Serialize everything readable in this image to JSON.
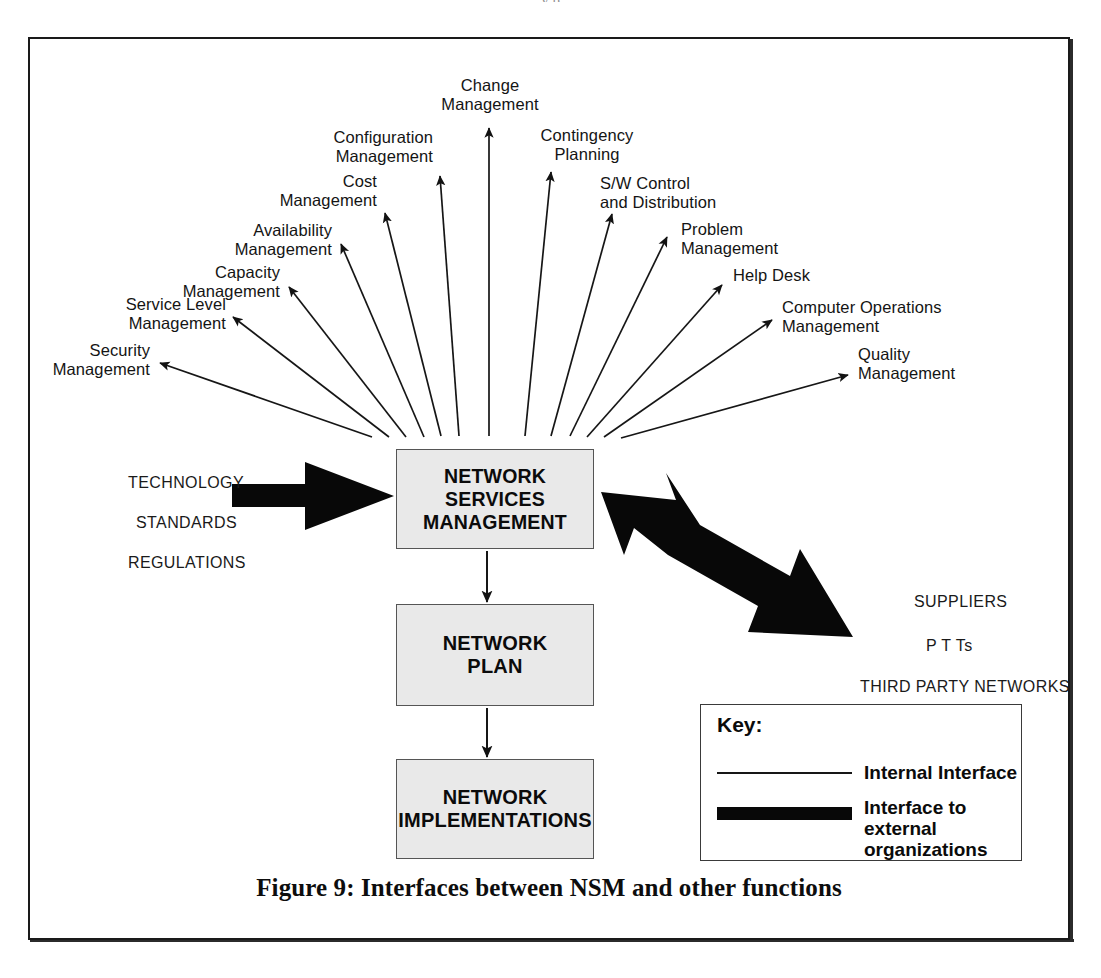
{
  "figure": {
    "caption": "Figure 9: Interfaces between NSM and other functions",
    "top_partial_text": "y   p"
  },
  "fan_functions": [
    {
      "id": "security-management",
      "label": "Security\nManagement"
    },
    {
      "id": "service-level-management",
      "label": "Service Level\nManagement"
    },
    {
      "id": "capacity-management",
      "label": "Capacity\nManagement"
    },
    {
      "id": "availability-management",
      "label": "Availability\nManagement"
    },
    {
      "id": "cost-management",
      "label": "Cost\nManagement"
    },
    {
      "id": "configuration-management",
      "label": "Configuration\nManagement"
    },
    {
      "id": "change-management",
      "label": "Change\nManagement"
    },
    {
      "id": "contingency-planning",
      "label": "Contingency\nPlanning"
    },
    {
      "id": "sw-control-and-distribution",
      "label": "S/W Control\nand Distribution"
    },
    {
      "id": "problem-management",
      "label": "Problem\nManagement"
    },
    {
      "id": "help-desk",
      "label": "Help Desk"
    },
    {
      "id": "computer-operations-management",
      "label": "Computer Operations\nManagement"
    },
    {
      "id": "quality-management",
      "label": "Quality\nManagement"
    }
  ],
  "boxes": {
    "nsm": {
      "label": "NETWORK\nSERVICES\nMANAGEMENT"
    },
    "plan": {
      "label": "NETWORK\nPLAN"
    },
    "impl": {
      "label": "NETWORK\nIMPLEMENTATIONS"
    }
  },
  "external_inputs": {
    "items": [
      "TECHNOLOGY",
      "STANDARDS",
      "REGULATIONS"
    ]
  },
  "external_parties": {
    "items": [
      "SUPPLIERS",
      "P T Ts",
      "THIRD PARTY NETWORKS"
    ]
  },
  "key": {
    "title": "Key:",
    "internal_label": "Internal Interface",
    "external_label": "Interface to external organizations"
  },
  "colors": {
    "ink": "#111111",
    "box_fill": "#e9e9e9",
    "box_border": "#555555",
    "frame": "#1a1a1a",
    "thick_arrow": "#080808"
  },
  "diagram_meta": {
    "type": "hub-and-spoke block diagram",
    "hub": "NETWORK SERVICES MANAGEMENT",
    "spoke_count": 13,
    "flow_chain": [
      "NETWORK SERVICES MANAGEMENT",
      "NETWORK PLAN",
      "NETWORK IMPLEMENTATIONS"
    ]
  }
}
